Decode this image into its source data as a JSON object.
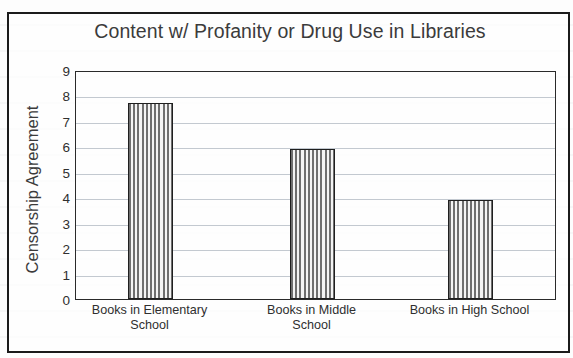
{
  "chart_data": {
    "type": "bar",
    "title": "Content w/ Profanity or Drug Use in Libraries",
    "xlabel": "",
    "ylabel": "Censorship Agreement",
    "categories": [
      "Books in Elementary School",
      "Books in Middle School",
      "Books in High School"
    ],
    "values": [
      7.7,
      5.9,
      3.9
    ],
    "ylim": [
      0,
      9
    ],
    "ytick_labels": [
      "9",
      "8",
      "7",
      "6",
      "5",
      "4",
      "3",
      "2",
      "1",
      "0"
    ],
    "ytick_values": [
      9,
      8,
      7,
      6,
      5,
      4,
      3,
      2,
      1,
      0
    ],
    "grid": true,
    "legend": false,
    "bar_fill": "vertical-stripe-pattern",
    "colors": {
      "bar_stripe_dark": "#6e6e6e",
      "bar_stripe_light": "#f3f3f3",
      "bar_outline": "#1f1f1f",
      "gridline": "#c3c9d0",
      "axis": "#2a2a2a",
      "text": "#3b3b3b",
      "background": "#ffffff"
    }
  },
  "category_lines": [
    [
      "Books in Elementary",
      "School"
    ],
    [
      "Books in Middle",
      "School"
    ],
    [
      "Books in High School",
      ""
    ]
  ]
}
